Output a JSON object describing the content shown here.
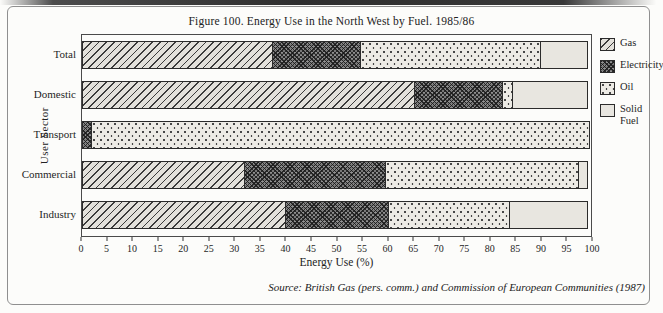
{
  "figure": {
    "title": "Figure 100.  Energy Use in the North West by Fuel. 1985/86",
    "source": "Source: British Gas (pers. comm.) and Commission of European Communities (1987)"
  },
  "colors": {
    "paper": "#fcfcfa",
    "ink": "#2b2b2b",
    "frame_border": "#8f8f8f",
    "gas_fill": "#e3e1db",
    "electricity_fill": "#787878",
    "oil_fill": "#edebe5",
    "solid_fuel_fill": "#e8e6e0"
  },
  "chart_data": {
    "type": "bar",
    "orientation": "horizontal",
    "stacked": true,
    "title": "Figure 100.  Energy Use in the North West by Fuel. 1985/86",
    "categories": [
      "Total",
      "Domestic",
      "Transport",
      "Commercial",
      "Industry"
    ],
    "series": [
      {
        "name": "Gas",
        "pattern": "gas",
        "values": [
          37.5,
          65.5,
          0,
          32,
          40
        ]
      },
      {
        "name": "Electricity",
        "pattern": "electricity",
        "values": [
          17.5,
          17.5,
          2,
          28,
          20.5
        ]
      },
      {
        "name": "Oil",
        "pattern": "oil",
        "values": [
          35.5,
          2,
          98,
          38,
          24
        ]
      },
      {
        "name": "Solid Fuel",
        "pattern": "solidfuel",
        "values": [
          9.5,
          15,
          0,
          2,
          15.5
        ]
      }
    ],
    "xlabel": "Energy Use (%)",
    "ylabel": "User Sector",
    "xlim": [
      0,
      100
    ],
    "x_ticks": [
      0,
      5,
      10,
      15,
      20,
      25,
      30,
      35,
      40,
      45,
      50,
      55,
      60,
      65,
      70,
      75,
      80,
      85,
      90,
      95,
      100
    ],
    "legend_position": "right",
    "grid": false
  }
}
